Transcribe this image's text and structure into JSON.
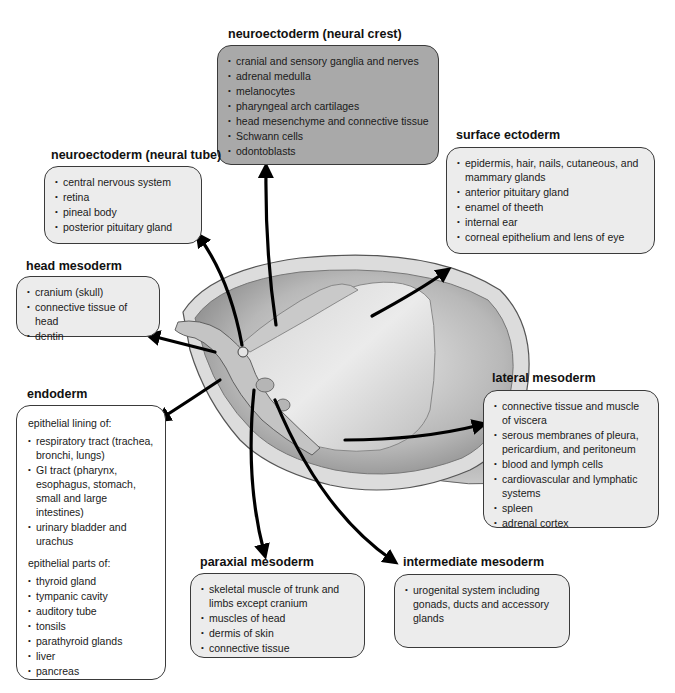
{
  "diagram": {
    "colors": {
      "box_default": "#ececec",
      "box_neural_crest": "#a9a9a9",
      "box_endoderm": "#ffffff",
      "border": "#3a3a3a",
      "arrow": "#000000"
    },
    "groups": {
      "neural_crest": {
        "title": "neuroectoderm (neural crest)",
        "items": [
          "cranial and sensory ganglia and nerves",
          "adrenal medulla",
          "melanocytes",
          "pharyngeal arch cartilages",
          "head mesenchyme and connective tissue",
          "Schwann cells",
          "odontoblasts"
        ]
      },
      "neural_tube": {
        "title": "neuroectoderm (neural tube)",
        "items": [
          "central nervous system",
          "retina",
          "pineal body",
          "posterior pituitary gland"
        ]
      },
      "surface_ectoderm": {
        "title": "surface ectoderm",
        "items": [
          "epidermis, hair, nails, cutaneous, and mammary glands",
          "anterior pituitary gland",
          "enamel of theeth",
          "internal ear",
          "corneal epithelium and lens of eye"
        ]
      },
      "head_mesoderm": {
        "title": "head mesoderm",
        "items": [
          "cranium (skull)",
          "connective tissue of head",
          "dentin"
        ]
      },
      "endoderm": {
        "title": "endoderm",
        "sub1": "epithelial lining of:",
        "items1": [
          "respiratory tract (trachea, bronchi, lungs)",
          "GI tract (pharynx, esophagus, stomach, small and large intestines)",
          "urinary bladder and urachus"
        ],
        "sub2": "epithelial parts of:",
        "items2": [
          "thyroid gland",
          "tympanic cavity",
          "auditory tube",
          "tonsils",
          "parathyroid glands",
          "liver",
          "pancreas"
        ]
      },
      "lateral_mesoderm": {
        "title": "lateral mesoderm",
        "items": [
          "connective tissue and muscle of viscera",
          "serous membranes of pleura, pericardium, and peritoneum",
          "blood and lymph cells",
          "cardiovascular and lymphatic systems",
          "spleen",
          "adrenal cortex"
        ]
      },
      "paraxial_mesoderm": {
        "title": "paraxial mesoderm",
        "items": [
          "skeletal muscle of trunk and limbs except cranium",
          "muscles of head",
          "dermis of skin",
          "connective tissue"
        ]
      },
      "intermediate_mesoderm": {
        "title": "intermediate mesoderm",
        "items": [
          "urogenital system including gonads, ducts and accessory glands"
        ]
      }
    }
  }
}
